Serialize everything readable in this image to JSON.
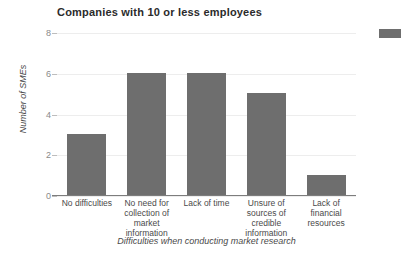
{
  "chart_data": {
    "type": "bar",
    "title": "Companies with 10 or less employees",
    "xlabel": "Difficulties when conducting market research",
    "ylabel": "Number of SMEs",
    "categories": [
      "No difficulties",
      "No need for collection of market information",
      "Lack of time",
      "Unsure of sources of credible information",
      "Lack of financial resources"
    ],
    "values": [
      3,
      6,
      6,
      5,
      1
    ],
    "ylim": [
      0,
      8
    ],
    "ytick_labels": [
      "0",
      "2",
      "4",
      "6",
      "8"
    ],
    "ytick_values": [
      0,
      2,
      4,
      6,
      8
    ],
    "grid": true,
    "legend_position": "top-right",
    "legend_label": "",
    "bar_color": "#6e6e6e",
    "grid_color": "#ededed",
    "axis_color": "#7d7d7d"
  }
}
